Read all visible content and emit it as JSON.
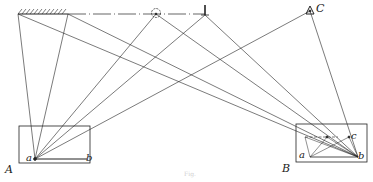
{
  "figure": {
    "caption": "Fig.",
    "labels": {
      "station_A": "A",
      "station_B": "B",
      "point_C": "C",
      "A_a": "a",
      "A_b": "b",
      "B_a": "a",
      "B_b": "b",
      "B_c": "c"
    },
    "elements": [
      {
        "name": "hatched-wall",
        "description": "hatched wall segment at top-left"
      },
      {
        "name": "dash-dot-baseline",
        "description": "dash-dot line across the top"
      },
      {
        "name": "tree-symbol",
        "description": "small circular tree/bush marker on baseline"
      },
      {
        "name": "post-marker",
        "description": "vertical post marker at end of baseline"
      },
      {
        "name": "triangle-C",
        "description": "triangulation point marked C"
      },
      {
        "name": "plane-table-A",
        "description": "rectangle A with points a and b"
      },
      {
        "name": "plane-table-B",
        "description": "rectangle B with points a, b and c"
      }
    ]
  }
}
